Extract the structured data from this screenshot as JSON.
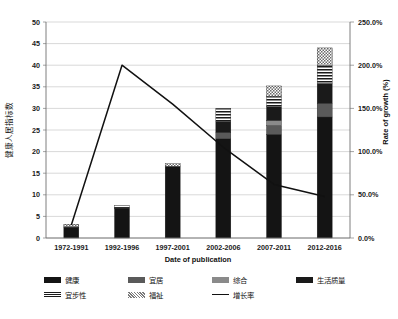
{
  "chart_data": {
    "type": "bar",
    "title": "",
    "subtitle": "",
    "xlabel": "Date of publication",
    "ylabel": "健康人居指标数",
    "y2label": "Rate of growth (%)",
    "categories": [
      "1972-1991",
      "1992-1996",
      "1997-2001",
      "2002-2006",
      "2007-2011",
      "2012-2016"
    ],
    "ylim": [
      0,
      50
    ],
    "ytick_step": 5,
    "yticks": [
      "0",
      "5",
      "10",
      "15",
      "20",
      "25",
      "30",
      "35",
      "40",
      "45",
      "50"
    ],
    "y2lim": [
      0,
      250
    ],
    "y2ticks": [
      "0.0%",
      "50.0%",
      "100.0%",
      "150.0%",
      "200.0%",
      "250.0%"
    ],
    "grid": true,
    "legend_position": "bottom",
    "stacked": true,
    "series": [
      {
        "name": "健康",
        "pattern": "solid-black",
        "color": "#141414",
        "values": [
          2.4,
          6.9,
          16.6,
          23.0,
          24.0,
          28.0
        ]
      },
      {
        "name": "宜居",
        "pattern": "solid-darkgray",
        "color": "#5a5a5a",
        "values": [
          0.0,
          0.0,
          0.0,
          1.4,
          2.0,
          3.2
        ]
      },
      {
        "name": "综合",
        "pattern": "solid-gray",
        "color": "#8a8a8a",
        "values": [
          0.0,
          0.0,
          0.0,
          0.0,
          1.2,
          0.0
        ]
      },
      {
        "name": "生活质量",
        "pattern": "solid-black2",
        "color": "#1a1a1a",
        "values": [
          0.2,
          0.2,
          0.0,
          2.6,
          3.2,
          4.6
        ]
      },
      {
        "name": "宜步性",
        "pattern": "horizontal-stripes",
        "color": "#ffffff",
        "values": [
          0.0,
          0.4,
          0.0,
          3.0,
          2.4,
          4.2
        ]
      },
      {
        "name": "福祉",
        "pattern": "dotted",
        "color": "#ffffff",
        "values": [
          0.6,
          0.0,
          0.6,
          0.0,
          2.4,
          4.0
        ]
      }
    ],
    "line_series": {
      "name": "增长率",
      "color": "#111111",
      "axis": "right",
      "values_percent": [
        15,
        200,
        155,
        105,
        62,
        48
      ]
    }
  },
  "legend": {
    "items": [
      {
        "label": "健康",
        "swatch": "solid-black"
      },
      {
        "label": "宜居",
        "swatch": "solid-darkgray"
      },
      {
        "label": "综合",
        "swatch": "solid-gray"
      },
      {
        "label": "生活质量",
        "swatch": "solid-black2"
      },
      {
        "label": "宜步性",
        "swatch": "horizontal-stripes"
      },
      {
        "label": "福祉",
        "swatch": "dotted"
      },
      {
        "label": "增长率",
        "swatch": "line"
      }
    ]
  }
}
